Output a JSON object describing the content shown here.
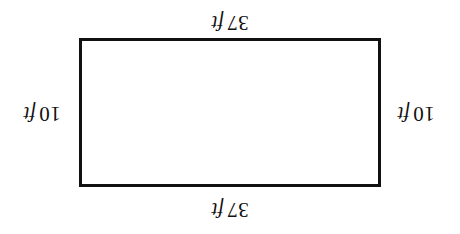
{
  "figure": {
    "type": "geometry-diagram",
    "shape": "rectangle",
    "orientation_degrees": 180,
    "background_color": "#ffffff",
    "stroke_color": "#111111",
    "text_color": "#111111"
  },
  "labels": {
    "top": {
      "number": "37",
      "unit": "ft",
      "full": "37 ft"
    },
    "bottom": {
      "number": "37",
      "unit": "ft",
      "full": "37 ft"
    },
    "left": {
      "number": "10",
      "unit": "ft",
      "full": "10 ft"
    },
    "right": {
      "number": "10",
      "unit": "ft",
      "full": "10 ft"
    }
  },
  "chart_data": {
    "type": "diagram",
    "title": "",
    "shape": "rectangle",
    "dimensions": {
      "width": {
        "value": 37,
        "unit": "ft",
        "label": "37 ft"
      },
      "height": {
        "value": 10,
        "unit": "ft",
        "label": "10 ft"
      }
    },
    "side_labels": [
      {
        "side": "top",
        "value": 37,
        "unit": "ft",
        "label": "37 ft"
      },
      {
        "side": "right",
        "value": 10,
        "unit": "ft",
        "label": "10 ft"
      },
      {
        "side": "bottom",
        "value": 37,
        "unit": "ft",
        "label": "37 ft"
      },
      {
        "side": "left",
        "value": 10,
        "unit": "ft",
        "label": "10 ft"
      }
    ]
  }
}
